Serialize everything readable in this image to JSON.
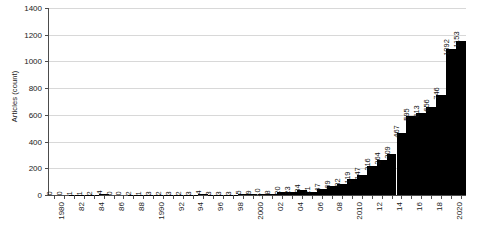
{
  "chart_data": {
    "type": "bar",
    "title": "",
    "subtitle": "",
    "xlabel": "",
    "ylabel": "Articles (count)",
    "ylim": [
      0,
      1400
    ],
    "ytick_step": 200,
    "ytick_labels": [
      "0",
      "200",
      "400",
      "600",
      "800",
      "1000",
      "1200",
      "1400"
    ],
    "grid": "horizontal",
    "legend": "none",
    "bar_color": "#000000",
    "grid_color": "#d8d8d8",
    "axis_color": "#4c4c4c",
    "show_value_labels": true,
    "value_label_rotation": -90,
    "xtick_label_rotation": -90,
    "xtick_label_interval": 2,
    "categories": [
      "1980",
      "1981",
      "1982",
      "1983",
      "1984",
      "1985",
      "1986",
      "1987",
      "1988",
      "1989",
      "1990",
      "1991",
      "1992",
      "1993",
      "1994",
      "1995",
      "1996",
      "1997",
      "1998",
      "1999",
      "2000",
      "2001",
      "2002",
      "2003",
      "2004",
      "2005",
      "2006",
      "2007",
      "2008",
      "2009",
      "2010",
      "2011",
      "2012",
      "2013",
      "2014",
      "2015",
      "2016",
      "2017",
      "2018",
      "2019",
      "2020",
      "2021"
    ],
    "xtick_labels": [
      "1980",
      "",
      "82",
      "",
      "84",
      "",
      "86",
      "",
      "88",
      "",
      "1990",
      "",
      "92",
      "",
      "94",
      "",
      "96",
      "",
      "98",
      "",
      "2000",
      "",
      "02",
      "",
      "04",
      "",
      "06",
      "",
      "08",
      "",
      "2010",
      "",
      "12",
      "",
      "14",
      "",
      "16",
      "",
      "18",
      "",
      "2020",
      ""
    ],
    "values": [
      0,
      0,
      1,
      1,
      2,
      4,
      0,
      0,
      2,
      1,
      3,
      2,
      3,
      2,
      3,
      4,
      3,
      3,
      3,
      5,
      9,
      10,
      8,
      20,
      23,
      34,
      21,
      47,
      69,
      82,
      119,
      147,
      216,
      264,
      309,
      467,
      595,
      613,
      656,
      746,
      1092,
      1153
    ],
    "value_labels": [
      "0",
      "0",
      "1",
      "1",
      "2",
      "4",
      "0",
      "0",
      "2",
      "1",
      "3",
      "2",
      "3",
      "2",
      "3",
      "4",
      "3",
      "3",
      "3",
      "5",
      "9",
      "10",
      "8",
      "20",
      "23",
      "34",
      "21",
      "47",
      "69",
      "82",
      "119",
      "147",
      "216",
      "264",
      "309",
      "467",
      "595",
      "613",
      "656",
      "746",
      "1092",
      "1153"
    ]
  }
}
